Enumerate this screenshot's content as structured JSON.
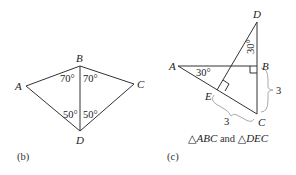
{
  "figure_b": {
    "caption": "(b)",
    "vertices": {
      "A": "A",
      "B": "B",
      "C": "C",
      "D": "D"
    },
    "angles": {
      "ABD": "70°",
      "DBC": "70°",
      "ADB": "50°",
      "BDC": "50°"
    }
  },
  "figure_c": {
    "caption": "(c)",
    "vertices": {
      "A": "A",
      "B": "B",
      "C": "C",
      "D": "D",
      "E": "E"
    },
    "angles": {
      "A": "30°",
      "D": "30°"
    },
    "lengths": {
      "BC": "3",
      "EC": "3"
    },
    "description_parts": {
      "tri1": "△ABC",
      "and": " and ",
      "tri2": "△DEC"
    }
  }
}
